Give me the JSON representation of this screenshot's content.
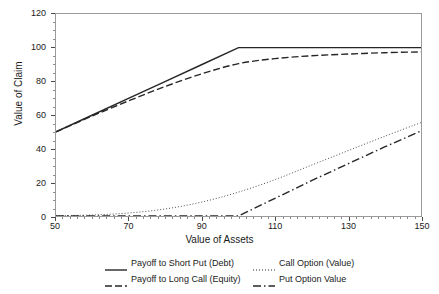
{
  "chart_data": {
    "type": "line",
    "title": "",
    "xlabel": "Value of Assets",
    "ylabel": "Value of Claim",
    "xlim": [
      50,
      150
    ],
    "ylim": [
      0,
      120
    ],
    "xticks": [
      50,
      70,
      90,
      110,
      130,
      150
    ],
    "yticks": [
      0,
      20,
      40,
      60,
      80,
      100,
      120
    ],
    "xtick_labels": [
      "50",
      "70",
      "90",
      "110",
      "130",
      "150"
    ],
    "ytick_labels": [
      "0",
      "20",
      "40",
      "60",
      "80",
      "100",
      "120"
    ],
    "x_minor_tick_step": 2,
    "y_minor_tick_step": 5,
    "grid": false,
    "legend_position": "below-axes",
    "strike": 100,
    "series": [
      {
        "name": "Payoff to Short Put (Debt)",
        "style": "solid",
        "color": "#262626",
        "x": [
          50,
          60,
          70,
          80,
          90,
          100,
          110,
          120,
          130,
          140,
          150
        ],
        "values": [
          50,
          60,
          70,
          80,
          90,
          100,
          100,
          100,
          100,
          100,
          100
        ]
      },
      {
        "name": "Payoff to Long Call (Equity)",
        "style": "dashdot",
        "color": "#262626",
        "x": [
          50,
          60,
          70,
          80,
          90,
          100,
          110,
          120,
          130,
          140,
          150
        ],
        "values": [
          50,
          59.5,
          68.5,
          77,
          84.5,
          90.5,
          93.5,
          95.2,
          96.2,
          97,
          97.5
        ]
      },
      {
        "name": "Call Option (Value)",
        "style": "dotted",
        "color": "#4a4a4a",
        "x": [
          50,
          60,
          70,
          80,
          90,
          100,
          110,
          120,
          130,
          140,
          150
        ],
        "values": [
          0.2,
          0.6,
          1.8,
          4.2,
          8.3,
          14.2,
          21.6,
          30.2,
          38.8,
          47.3,
          55.5
        ]
      },
      {
        "name": "Put Option Value",
        "style": "dashdot-long",
        "color": "#262626",
        "x": [
          50,
          60,
          70,
          80,
          90,
          100,
          110,
          120,
          130,
          140,
          150
        ],
        "values": [
          0,
          0,
          0,
          0,
          0,
          0,
          10.5,
          21.0,
          31.0,
          41.0,
          50.5
        ]
      }
    ]
  },
  "legend": {
    "entries": [
      {
        "label": "Payoff to Short Put (Debt)",
        "style": "solid"
      },
      {
        "label": "Call Option (Value)",
        "style": "dotted"
      },
      {
        "label": "Payoff to Long Call (Equity)",
        "style": "dashdot"
      },
      {
        "label": "Put Option Value",
        "style": "dashdot-long"
      }
    ]
  }
}
